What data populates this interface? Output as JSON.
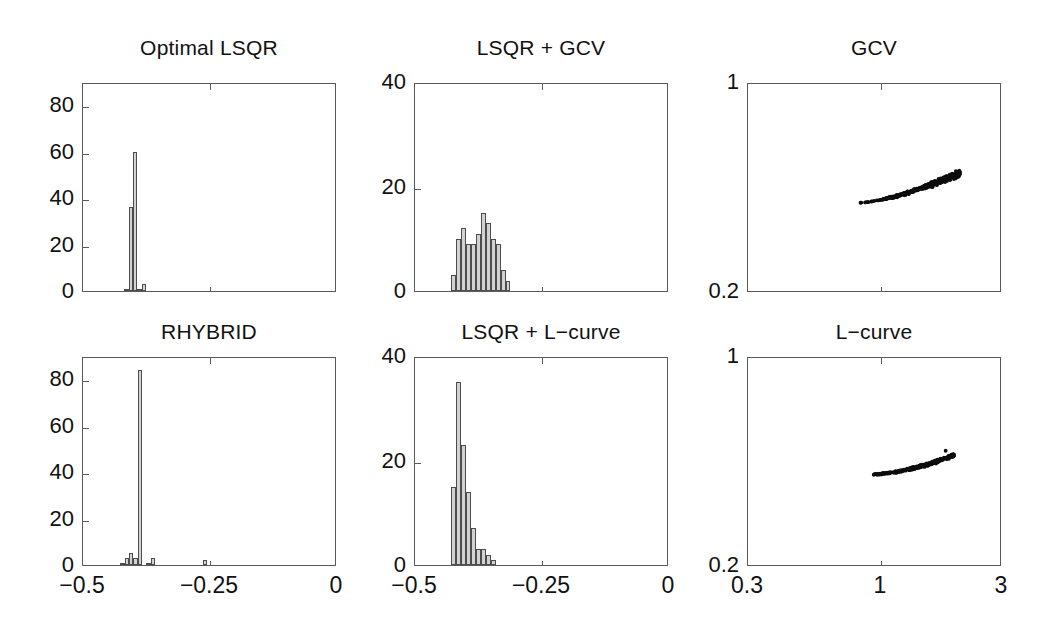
{
  "figure": {
    "background_color": "#ffffff",
    "axis_color": "#5a5a5a",
    "bar_fill_color": "#d2d2d2",
    "bar_edge_color": "#4d4d4d",
    "dot_color": "#0d0d0d"
  },
  "chart_data": [
    {
      "id": "optimal-lsqr",
      "type": "bar",
      "title": "Optimal LSQR",
      "xlabel": "",
      "ylabel": "",
      "xlim": [
        -0.5,
        0
      ],
      "ylim": [
        0,
        90
      ],
      "xticks": [
        -0.5,
        -0.25,
        0
      ],
      "xticklabels": [
        "",
        "",
        ""
      ],
      "yticks": [
        0,
        20,
        40,
        60,
        80
      ],
      "yticklabels": [
        "0",
        "20",
        "40",
        "60",
        "80"
      ],
      "grid": false,
      "legend": "none",
      "bin_width": 0.0085,
      "bin_starts": [
        -0.4185,
        -0.41,
        -0.4015,
        -0.393,
        -0.3845
      ],
      "values": [
        1,
        36,
        60,
        1,
        3
      ]
    },
    {
      "id": "lsqr-gcv",
      "type": "bar",
      "title": "LSQR + GCV",
      "xlabel": "",
      "ylabel": "",
      "xlim": [
        -0.5,
        0
      ],
      "ylim": [
        0,
        40
      ],
      "xticks": [
        -0.5,
        -0.25,
        0
      ],
      "xticklabels": [
        "",
        "",
        ""
      ],
      "yticks": [
        0,
        20,
        40
      ],
      "yticklabels": [
        "0",
        "20",
        "40"
      ],
      "grid": false,
      "legend": "none",
      "bin_width": 0.0098,
      "bin_starts": [
        -0.4296,
        -0.4198,
        -0.41,
        -0.4002,
        -0.3904,
        -0.3806,
        -0.3708,
        -0.361,
        -0.3512,
        -0.3414,
        -0.3316,
        -0.3218
      ],
      "values": [
        3,
        10,
        12,
        9,
        9,
        11,
        15,
        13,
        10,
        9,
        4,
        2
      ]
    },
    {
      "id": "gcv-scatter",
      "type": "scatter",
      "title": "GCV",
      "xlabel": "",
      "ylabel": "",
      "xscale": "log",
      "xlim": [
        0.3,
        3
      ],
      "ylim": [
        0.2,
        1
      ],
      "xticks": [
        0.3,
        1,
        3
      ],
      "xticklabels": [
        "0.3",
        "1",
        "3"
      ],
      "yticks": [
        0.2,
        1
      ],
      "yticklabels": [
        "0.2",
        "1"
      ],
      "grid": false,
      "legend": "none",
      "cluster_shape": "comma / tadpole: thin sparse tail toward lower-left, dense blob upper-right",
      "cluster_x_range": [
        0.82,
        2.05
      ],
      "cluster_y_range": [
        0.545,
        0.66
      ],
      "n_points": 300
    },
    {
      "id": "rhybrid",
      "type": "bar",
      "title": "RHYBRID",
      "xlabel": "",
      "ylabel": "",
      "xlim": [
        -0.5,
        0
      ],
      "ylim": [
        0,
        90
      ],
      "xticks": [
        -0.5,
        -0.25,
        0
      ],
      "xticklabels": [
        "-0.5",
        "-0.25",
        "0"
      ],
      "yticks": [
        0,
        20,
        40,
        60,
        80
      ],
      "yticklabels": [
        "0",
        "20",
        "40",
        "60",
        "80"
      ],
      "grid": false,
      "legend": "none",
      "bin_width": 0.0085,
      "bin_starts": [
        -0.4262,
        -0.4177,
        -0.4092,
        -0.4007,
        -0.3922,
        -0.3837,
        -0.3752,
        -0.3667,
        -0.3582,
        -0.2645
      ],
      "values": [
        1,
        3,
        5,
        3,
        84,
        0,
        1,
        3,
        0,
        2
      ]
    },
    {
      "id": "lsqr-lcurve",
      "type": "bar",
      "title": "LSQR + L-curve",
      "xlabel": "",
      "ylabel": "",
      "xlim": [
        -0.5,
        0
      ],
      "ylim": [
        0,
        40
      ],
      "xticks": [
        -0.5,
        -0.25,
        0
      ],
      "xticklabels": [
        "-0.5",
        "-0.25",
        "0"
      ],
      "yticks": [
        0,
        20,
        40
      ],
      "yticklabels": [
        "0",
        "20",
        "40"
      ],
      "grid": false,
      "legend": "none",
      "bin_width": 0.0098,
      "bin_starts": [
        -0.4296,
        -0.4198,
        -0.41,
        -0.4002,
        -0.3904,
        -0.3806,
        -0.3708,
        -0.361,
        -0.3512
      ],
      "values": [
        15,
        35,
        23,
        14,
        7,
        3,
        3,
        2,
        1
      ]
    },
    {
      "id": "lcurve-scatter",
      "type": "scatter",
      "title": "L-curve",
      "xlabel": "",
      "ylabel": "",
      "xscale": "log",
      "xlim": [
        0.3,
        3
      ],
      "ylim": [
        0.2,
        1
      ],
      "xticks": [
        0.3,
        1,
        3
      ],
      "xticklabels": [
        "0.3",
        "1",
        "3"
      ],
      "yticks": [
        0.2,
        1
      ],
      "yticklabels": [
        "0.2",
        "1"
      ],
      "grid": false,
      "legend": "none",
      "cluster_shape": "narrow banana arc sloping up to the right, one outlier dot above right end",
      "cluster_x_range": [
        0.93,
        1.95
      ],
      "cluster_y_range": [
        0.555,
        0.63
      ],
      "n_points": 300
    }
  ],
  "panels": {
    "optimal_lsqr": {
      "title": "Optimal LSQR",
      "yticklabels": [
        "0",
        "20",
        "40",
        "60",
        "80"
      ],
      "xticklabels": [
        "",
        "",
        ""
      ]
    },
    "lsqr_gcv": {
      "title": "LSQR + GCV",
      "yticklabels": [
        "0",
        "20",
        "40"
      ],
      "xticklabels": [
        "",
        "",
        ""
      ]
    },
    "gcv": {
      "title": "GCV",
      "yticklabels": [
        "0.2",
        "1"
      ],
      "xticklabels": [
        "",
        "",
        ""
      ]
    },
    "rhybrid": {
      "title": "RHYBRID",
      "yticklabels": [
        "0",
        "20",
        "40",
        "60",
        "80"
      ],
      "xticklabels": [
        "−0.5",
        "−0.25",
        "0"
      ]
    },
    "lsqr_lcurve": {
      "title": "LSQR + L−curve",
      "yticklabels": [
        "0",
        "20",
        "40"
      ],
      "xticklabels": [
        "−0.5",
        "−0.25",
        "0"
      ]
    },
    "lcurve": {
      "title": "L−curve",
      "yticklabels": [
        "0.2",
        "1"
      ],
      "xticklabels": [
        "0.3",
        "1",
        "3"
      ]
    }
  }
}
